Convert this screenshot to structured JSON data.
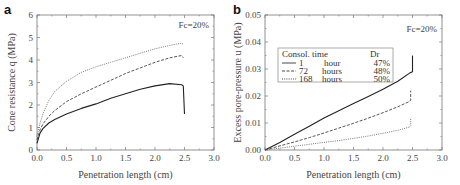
{
  "chart_data": [
    {
      "panel": "a",
      "type": "line",
      "title": "",
      "annotation": "Fc=20%",
      "xlabel": "Penetration length (cm)",
      "ylabel": "Cone resistance q_c (MPa)",
      "xlim": [
        0.0,
        3.0
      ],
      "ylim": [
        0,
        6
      ],
      "xticks": [
        "0.0",
        "0.5",
        "1.0",
        "1.5",
        "2.0",
        "2.5",
        "3.0"
      ],
      "yticks": [
        "0",
        "1",
        "2",
        "3",
        "4",
        "5",
        "6"
      ],
      "grid": false,
      "series": [
        {
          "name": "1 hour (Dr 47%)",
          "style": "solid",
          "color": "#222222",
          "x": [
            0.0,
            0.05,
            0.1,
            0.2,
            0.3,
            0.5,
            0.75,
            1.0,
            1.25,
            1.5,
            1.75,
            2.0,
            2.25,
            2.45,
            2.48,
            2.5
          ],
          "y": [
            0.3,
            0.75,
            0.95,
            1.2,
            1.35,
            1.6,
            1.85,
            2.05,
            2.3,
            2.5,
            2.7,
            2.85,
            2.95,
            2.9,
            2.85,
            1.6
          ]
        },
        {
          "name": "72 hours (Dr 48%)",
          "style": "dashed",
          "color": "#444444",
          "x": [
            0.0,
            0.05,
            0.1,
            0.2,
            0.3,
            0.5,
            0.75,
            1.0,
            1.25,
            1.5,
            1.75,
            2.0,
            2.25,
            2.45,
            2.48
          ],
          "y": [
            0.45,
            0.9,
            1.15,
            1.5,
            1.75,
            2.15,
            2.5,
            2.8,
            3.1,
            3.4,
            3.65,
            3.9,
            4.1,
            4.2,
            4.1
          ]
        },
        {
          "name": "168 hours (Dr 50%)",
          "style": "dotted",
          "color": "#666666",
          "x": [
            0.0,
            0.05,
            0.1,
            0.2,
            0.3,
            0.5,
            0.75,
            1.0,
            1.25,
            1.5,
            1.75,
            2.0,
            2.25,
            2.45,
            2.48
          ],
          "y": [
            0.6,
            1.2,
            1.6,
            2.2,
            2.6,
            3.05,
            3.45,
            3.7,
            3.9,
            4.1,
            4.3,
            4.5,
            4.65,
            4.75,
            4.7
          ]
        }
      ]
    },
    {
      "panel": "b",
      "type": "line",
      "title": "",
      "annotation": "Fc=20%",
      "xlabel": "Penetration length (cm)",
      "ylabel": "Excess pore-pressure u (MPa)",
      "xlim": [
        0.0,
        3.0
      ],
      "ylim": [
        0.0,
        0.05
      ],
      "xticks": [
        "0.0",
        "0.5",
        "1.0",
        "1.5",
        "2.0",
        "2.5",
        "3.0"
      ],
      "yticks": [
        "0.00",
        "0.01",
        "0.02",
        "0.03",
        "0.04",
        "0.05"
      ],
      "grid": false,
      "legend": {
        "position": "upper-left",
        "header": [
          "Consol. time",
          "Dr"
        ],
        "entries": [
          {
            "time": "1",
            "unit": "hour",
            "dr": "47%",
            "style": "solid"
          },
          {
            "time": "72",
            "unit": "hours",
            "dr": "48%",
            "style": "dashed"
          },
          {
            "time": "168",
            "unit": "hours",
            "dr": "50%",
            "style": "dotted"
          }
        ]
      },
      "series": [
        {
          "name": "1 hour (Dr 47%)",
          "style": "solid",
          "color": "#222222",
          "x": [
            0.0,
            0.25,
            0.5,
            0.75,
            1.0,
            1.25,
            1.5,
            1.75,
            2.0,
            2.25,
            2.45,
            2.5,
            2.5
          ],
          "y": [
            0.0,
            0.0028,
            0.0058,
            0.0088,
            0.0118,
            0.0145,
            0.0172,
            0.0198,
            0.0225,
            0.0255,
            0.0285,
            0.029,
            0.035
          ]
        },
        {
          "name": "72 hours (Dr 48%)",
          "style": "dashed",
          "color": "#444444",
          "x": [
            0.0,
            0.25,
            0.5,
            0.75,
            1.0,
            1.25,
            1.5,
            1.75,
            2.0,
            2.25,
            2.45,
            2.47,
            2.47
          ],
          "y": [
            0.0,
            0.0015,
            0.003,
            0.0046,
            0.0063,
            0.0081,
            0.0099,
            0.0118,
            0.0138,
            0.016,
            0.018,
            0.0185,
            0.022
          ]
        },
        {
          "name": "168 hours (Dr 50%)",
          "style": "dotted",
          "color": "#666666",
          "x": [
            0.0,
            0.25,
            0.5,
            0.75,
            1.0,
            1.25,
            1.5,
            1.75,
            2.0,
            2.25,
            2.45,
            2.47,
            2.47
          ],
          "y": [
            0.0,
            0.0007,
            0.0014,
            0.0021,
            0.0028,
            0.0035,
            0.0043,
            0.0052,
            0.0062,
            0.0073,
            0.0085,
            0.009,
            0.012
          ]
        }
      ]
    }
  ]
}
